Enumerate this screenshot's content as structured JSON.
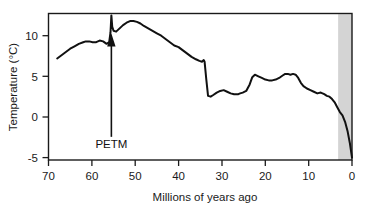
{
  "chart_data": {
    "type": "line",
    "title": "",
    "xlabel": "Millions of years ago",
    "ylabel": "Temperature (°C)",
    "xlim": [
      70,
      0
    ],
    "ylim": [
      -5,
      13
    ],
    "x_ticks": [
      70,
      60,
      50,
      40,
      30,
      20,
      10,
      0
    ],
    "x_tick_labels": [
      "70",
      "60",
      "50",
      "40",
      "30",
      "20",
      "10",
      "0"
    ],
    "y_ticks": [
      10,
      5,
      0,
      -5
    ],
    "y_tick_labels": [
      "10",
      "5",
      "0",
      "-5"
    ],
    "x_axis_inverted": true,
    "grid": false,
    "legend": false,
    "series": [
      {
        "name": "Global deep-sea temperature",
        "color": "#111111",
        "x": [
          68.0,
          67.0,
          66.0,
          65.0,
          64.0,
          63.0,
          62.0,
          61.4,
          60.6,
          59.8,
          59.0,
          58.2,
          57.4,
          56.6,
          56.0,
          55.7,
          55.5,
          55.3,
          55.0,
          54.4,
          53.6,
          52.8,
          52.0,
          51.2,
          50.4,
          49.6,
          48.8,
          48.0,
          47.0,
          46.0,
          45.0,
          44.0,
          43.0,
          42.0,
          41.0,
          40.0,
          39.0,
          38.0,
          37.0,
          36.0,
          35.2,
          34.6,
          34.2,
          34.0,
          33.6,
          33.2,
          32.6,
          32.0,
          31.2,
          30.4,
          29.6,
          28.8,
          28.0,
          27.2,
          26.6,
          26.2,
          25.8,
          25.2,
          24.4,
          23.6,
          23.0,
          22.4,
          21.6,
          20.8,
          20.0,
          19.2,
          18.4,
          17.6,
          16.8,
          16.0,
          15.4,
          14.8,
          14.2,
          13.6,
          13.0,
          12.4,
          11.8,
          11.2,
          10.4,
          9.6,
          8.8,
          8.0,
          7.2,
          6.4,
          5.8,
          5.2,
          4.6,
          4.0,
          3.4,
          2.8,
          2.2,
          1.6,
          1.0,
          0.5,
          0.0
        ],
        "y": [
          7.2,
          7.6,
          8.0,
          8.4,
          8.7,
          9.0,
          9.2,
          9.3,
          9.3,
          9.2,
          9.2,
          9.4,
          9.3,
          9.0,
          9.2,
          10.4,
          12.5,
          11.1,
          10.6,
          10.5,
          10.9,
          11.3,
          11.6,
          11.8,
          11.8,
          11.7,
          11.5,
          11.2,
          10.9,
          10.6,
          10.3,
          10.0,
          9.6,
          9.2,
          8.8,
          8.6,
          8.2,
          7.8,
          7.4,
          7.1,
          6.9,
          6.8,
          7.0,
          6.8,
          4.6,
          2.6,
          2.5,
          2.7,
          3.0,
          3.2,
          3.3,
          3.1,
          2.9,
          2.8,
          2.8,
          2.8,
          2.9,
          3.0,
          3.2,
          4.0,
          4.9,
          5.2,
          5.0,
          4.8,
          4.6,
          4.5,
          4.5,
          4.6,
          4.8,
          5.1,
          5.3,
          5.3,
          5.2,
          5.3,
          5.2,
          4.8,
          4.2,
          3.8,
          3.5,
          3.3,
          3.1,
          2.9,
          3.0,
          2.8,
          2.6,
          2.5,
          2.2,
          1.8,
          1.2,
          0.6,
          0.2,
          -0.6,
          -1.8,
          -3.2,
          -5.0
        ]
      }
    ],
    "annotations": [
      {
        "name": "petm-annotation",
        "label": "PETM",
        "x": 55.5,
        "y": -2.2,
        "arrow_to_x": 55.5,
        "arrow_to_y": 10.4,
        "description": "arrow pointing up to the temperature spike"
      }
    ],
    "shaded_bands": [
      {
        "name": "quaternary-band",
        "x_start": 3.2,
        "x_end": 0.0,
        "color": "#d4d4d4",
        "label": ""
      }
    ],
    "frame": {
      "color": "#1a1a1a",
      "top": true,
      "right": true,
      "bottom": true,
      "left": true
    }
  },
  "axes": {
    "x_title": "Millions of years ago",
    "y_title": "Temperature (°C)"
  },
  "colors": {
    "line": "#111111",
    "frame": "#1a1a1a",
    "band": "#d4d4d4",
    "text": "#1a1a1a",
    "background": "#ffffff"
  }
}
